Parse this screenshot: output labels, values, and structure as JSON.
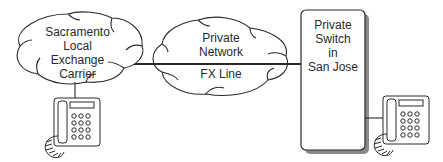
{
  "diagram": {
    "nodes": {
      "sacramento_cloud": {
        "lines": [
          "Sacramento",
          "Local",
          "Exchange",
          "Carrier"
        ]
      },
      "private_network_cloud": {
        "top_lines": [
          "Private",
          "Network"
        ],
        "bottom_label": "FX Line"
      },
      "private_switch": {
        "lines": [
          "Private",
          "Switch",
          "in",
          "San Jose"
        ]
      },
      "phone_left": {
        "icon": "telephone-icon"
      },
      "phone_right": {
        "icon": "telephone-icon"
      }
    },
    "edges": [
      {
        "from": "sacramento_cloud",
        "to": "phone_left"
      },
      {
        "from": "sacramento_cloud",
        "to": "private_switch",
        "via": "private_network_cloud",
        "label": "FX Line"
      },
      {
        "from": "private_switch",
        "to": "phone_right"
      }
    ],
    "colors": {
      "stroke": "#2a2a2a",
      "shadow": "#8a8a8a",
      "background": "#ffffff"
    }
  }
}
